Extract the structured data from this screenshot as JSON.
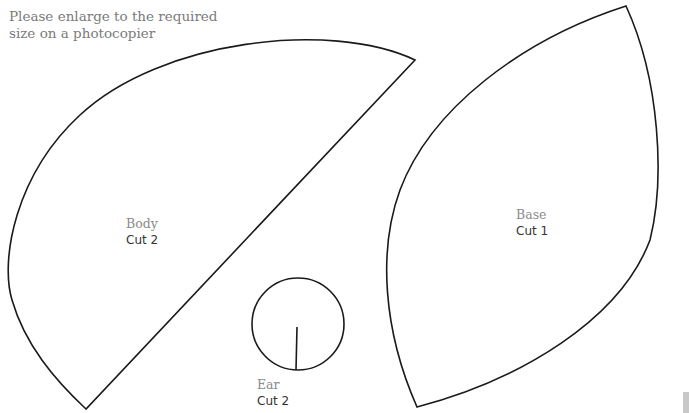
{
  "instructions": {
    "line1": "Please enlarge to the required",
    "line2": "size on a photocopier"
  },
  "pieces": [
    {
      "name": "Body",
      "cut": "Cut 2"
    },
    {
      "name": "Base",
      "cut": "Cut 1"
    },
    {
      "name": "Ear",
      "cut": "Cut 2"
    }
  ],
  "colors": {
    "outline": "#1a1a1a",
    "label": "#8a8a8a",
    "cut": "#333333"
  }
}
